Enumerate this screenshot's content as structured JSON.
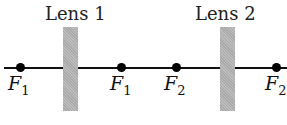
{
  "lenses": [
    {
      "label": "Lens 1"
    },
    {
      "label": "Lens 2"
    }
  ],
  "focal_points": [
    {
      "letter": "F",
      "sub": "1"
    },
    {
      "letter": "F",
      "sub": "1"
    },
    {
      "letter": "F",
      "sub": "2"
    },
    {
      "letter": "F",
      "sub": "2"
    }
  ]
}
